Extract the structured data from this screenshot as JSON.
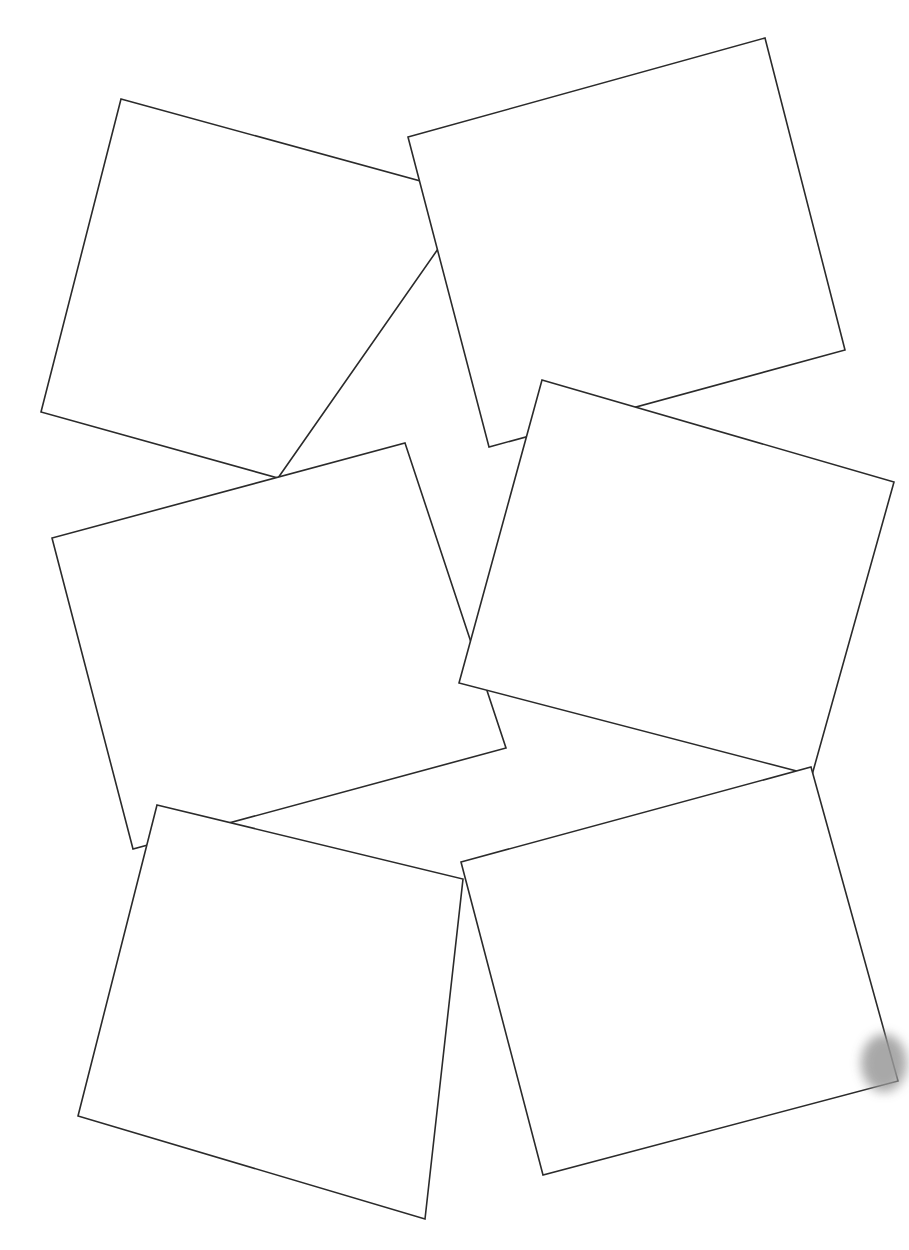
{
  "page": {
    "width": 909,
    "height": 1250,
    "background_color": "#ffffff"
  },
  "style": {
    "shape_fill": "#ffffff",
    "shape_stroke": "#2b2b2b",
    "shape_stroke_width": 1.6,
    "smudge_color": "#9a9a9a"
  },
  "chart_data": {
    "type": "scatter",
    "subtitle": "",
    "xlabel": "",
    "ylabel": "",
    "xlim": [
      0,
      909
    ],
    "ylim": [
      0,
      1250
    ],
    "grid": false,
    "legend": "none",
    "shape_count": 6,
    "shapes": [
      {
        "name": "square-top-left",
        "index": 1,
        "rotation_deg": 15.3,
        "center": [
          228.8,
          296.3
        ],
        "side_px": 366,
        "points": "121,99 475,196 278,478 41,412",
        "vertices": [
          [
            121,
            99
          ],
          [
            475,
            196
          ],
          [
            278,
            478
          ],
          [
            41,
            412
          ]
        ]
      },
      {
        "name": "square-top-right",
        "index": 2,
        "rotation_deg": -15.5,
        "center": [
          626.8,
          243.0
        ],
        "side_px": 370,
        "points": "408,137 765,38 845,350 489,447",
        "vertices": [
          [
            408,
            137
          ],
          [
            765,
            38
          ],
          [
            845,
            350
          ],
          [
            489,
            447
          ]
        ]
      },
      {
        "name": "square-middle-left",
        "index": 3,
        "rotation_deg": 71.7,
        "center": [
          274.0,
          644.5
        ],
        "side_px": 322,
        "points": "405,443 506,748 133,849 52,538",
        "vertices": [
          [
            405,
            443
          ],
          [
            506,
            748
          ],
          [
            133,
            849
          ],
          [
            52,
            538
          ]
        ]
      },
      {
        "name": "square-middle-right",
        "index": 4,
        "rotation_deg": 16.2,
        "center": [
          676.8,
          580.0
        ],
        "side_px": 366,
        "points": "542,380 894,482 812,775 459,683",
        "vertices": [
          [
            542,
            380
          ],
          [
            894,
            482
          ],
          [
            812,
            775
          ],
          [
            459,
            683
          ]
        ]
      },
      {
        "name": "square-bottom-left",
        "index": 5,
        "rotation_deg": 13.6,
        "center": [
          280.8,
          1004.8
        ],
        "side_px": 340,
        "points": "157,805 463,879 425,1219 78,1116",
        "vertices": [
          [
            157,
            805
          ],
          [
            463,
            879
          ],
          [
            425,
            1219
          ],
          [
            78,
            1116
          ]
        ]
      },
      {
        "name": "square-bottom-right",
        "index": 6,
        "rotation_deg": -15.2,
        "center": [
          678.3,
          971.3
        ],
        "side_px": 350,
        "points": "461,862 811,767 898,1081 543,1175",
        "vertices": [
          [
            461,
            862
          ],
          [
            811,
            767
          ],
          [
            898,
            1081
          ],
          [
            543,
            1175
          ]
        ]
      }
    ],
    "artifacts": [
      {
        "name": "blur-smudge",
        "kind": "gray-blur",
        "position": [
          884,
          1063
        ],
        "size": [
          46,
          58
        ],
        "color": "#9a9a9a"
      }
    ]
  }
}
